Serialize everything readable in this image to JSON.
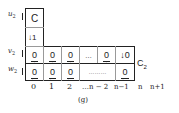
{
  "row_labels": {
    "u": "u",
    "v": "v",
    "w": "w",
    "subscript": "2"
  },
  "top_box": {
    "label": "C",
    "arrow_cell": "↓1"
  },
  "v_row": [
    "0",
    "0",
    "0",
    "…",
    "0",
    "↓0"
  ],
  "w_row": [
    "0",
    "0",
    "0",
    "………",
    "0"
  ],
  "v_row_arrows": [
    "→",
    "→",
    "→",
    "",
    "→",
    ""
  ],
  "w_row_arrows": [
    "←",
    "←",
    "←",
    "",
    "←"
  ],
  "side_label": {
    "text": "C",
    "subscript": "2"
  },
  "axis_labels": [
    "0",
    "1",
    "2",
    "…n − 2",
    "n−1",
    "n",
    "n+1"
  ],
  "caption": "(g)"
}
